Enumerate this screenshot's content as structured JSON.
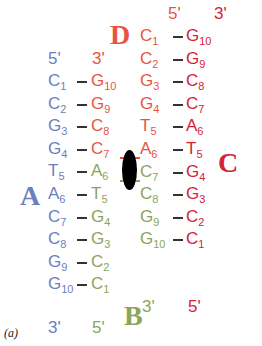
{
  "caption": "(a)",
  "strand_labels": {
    "A": "A",
    "B": "B",
    "C": "C",
    "D": "D"
  },
  "colors": {
    "A": "#6a7fc0",
    "B": "#8aa55a",
    "C": "#d42236",
    "D": "#e8553f"
  },
  "ends": {
    "d_top": "5'",
    "c_top": "3'",
    "a_top": "5'",
    "d_bottom": "3'",
    "b_bottom_right": "3'",
    "c_bottom": "5'",
    "a_bottom": "3'",
    "b_bottom": "5'"
  },
  "left_duplex": [
    {
      "a": "C",
      "an": "1",
      "o": "G",
      "on": "10",
      "oc": "orange"
    },
    {
      "a": "C",
      "an": "2",
      "o": "G",
      "on": "9",
      "oc": "orange"
    },
    {
      "a": "G",
      "an": "3",
      "o": "C",
      "on": "8",
      "oc": "orange"
    },
    {
      "a": "G",
      "an": "4",
      "o": "C",
      "on": "7",
      "oc": "orange"
    },
    {
      "a": "T",
      "an": "5",
      "o": "A",
      "on": "6",
      "oc": "green"
    },
    {
      "a": "A",
      "an": "6",
      "o": "T",
      "on": "5",
      "oc": "green"
    },
    {
      "a": "C",
      "an": "7",
      "o": "G",
      "on": "4",
      "oc": "green"
    },
    {
      "a": "C",
      "an": "8",
      "o": "G",
      "on": "3",
      "oc": "green"
    },
    {
      "a": "G",
      "an": "9",
      "o": "C",
      "on": "2",
      "oc": "green"
    },
    {
      "a": "G",
      "an": "10",
      "o": "C",
      "on": "1",
      "oc": "green"
    }
  ],
  "right_duplex": [
    {
      "l": "C",
      "ln": "1",
      "lc": "orange",
      "r": "G",
      "rn": "10"
    },
    {
      "l": "C",
      "ln": "2",
      "lc": "orange",
      "r": "G",
      "rn": "9"
    },
    {
      "l": "G",
      "ln": "3",
      "lc": "orange",
      "r": "C",
      "rn": "8"
    },
    {
      "l": "G",
      "ln": "4",
      "lc": "orange",
      "r": "C",
      "rn": "7"
    },
    {
      "l": "T",
      "ln": "5",
      "lc": "orange",
      "r": "A",
      "rn": "6"
    },
    {
      "l": "A",
      "ln": "6",
      "lc": "orange",
      "r": "T",
      "rn": "5"
    },
    {
      "l": "C",
      "ln": "7",
      "lc": "green",
      "r": "G",
      "rn": "4"
    },
    {
      "l": "C",
      "ln": "8",
      "lc": "green",
      "r": "G",
      "rn": "3"
    },
    {
      "l": "G",
      "ln": "9",
      "lc": "green",
      "r": "C",
      "rn": "2"
    },
    {
      "l": "G",
      "ln": "10",
      "lc": "green",
      "r": "C",
      "rn": "1"
    }
  ]
}
